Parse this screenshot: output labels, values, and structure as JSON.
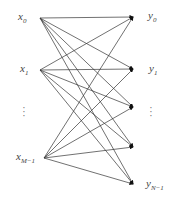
{
  "diagram": {
    "type": "bipartite-fully-connected-graph",
    "inputs": [
      {
        "id": "x0",
        "base": "x",
        "sub": "0",
        "x": 40,
        "y": 18,
        "label_x": 18,
        "label_y": 11
      },
      {
        "id": "x1",
        "base": "x",
        "sub": "1",
        "x": 40,
        "y": 70,
        "label_x": 20,
        "label_y": 63
      },
      {
        "id": "xM-1",
        "base": "x",
        "sub": "M−1",
        "x": 44,
        "y": 158,
        "label_x": 16,
        "label_y": 151
      }
    ],
    "input_ellipsis": {
      "symbol": "⋮",
      "x": 24,
      "y": 112
    },
    "outputs": [
      {
        "id": "y0",
        "base": "y",
        "sub": "0",
        "x": 134,
        "y": 17,
        "label_x": 148,
        "label_y": 10
      },
      {
        "id": "y1",
        "base": "y",
        "sub": "1",
        "x": 134,
        "y": 69,
        "label_x": 149,
        "label_y": 63
      },
      {
        "id": "y2",
        "base": "",
        "sub": "",
        "x": 134,
        "y": 107
      },
      {
        "id": "y3",
        "base": "",
        "sub": "",
        "x": 134,
        "y": 147
      },
      {
        "id": "yN-1",
        "base": "y",
        "sub": "N−1",
        "x": 134,
        "y": 184,
        "label_x": 146,
        "label_y": 178
      }
    ],
    "output_ellipsis": {
      "symbol": "⋮",
      "x": 151,
      "y": 112
    },
    "edges": "all-inputs-to-all-outputs",
    "colors": {
      "line": "#333333",
      "arrow": "#111111",
      "label": "#444444"
    }
  }
}
